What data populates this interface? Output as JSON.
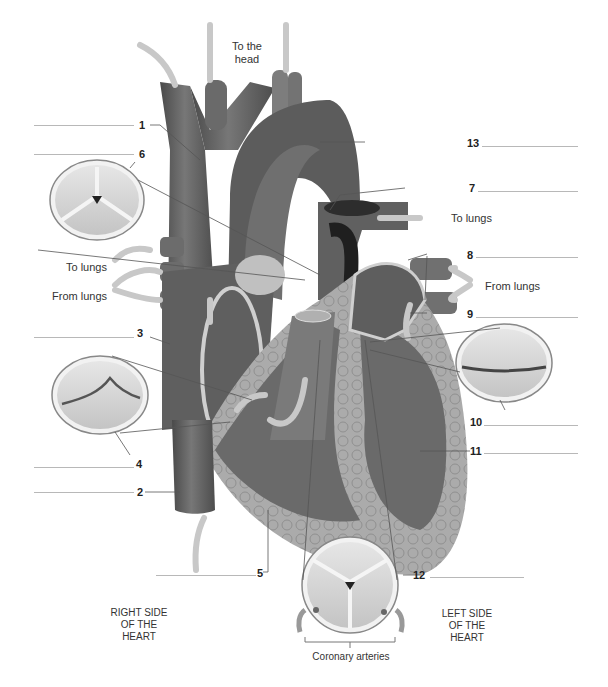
{
  "diagram": {
    "side_labels": {
      "right": "RIGHT SIDE OF THE HEART",
      "left": "LEFT SIDE OF THE HEART"
    },
    "flow_labels": {
      "to_head": "To the head",
      "to_lungs_right": "To lungs",
      "to_lungs_left": "To lungs",
      "from_lungs_left": "From lungs",
      "from_lungs_right": "From lungs"
    },
    "valve_caption": "Coronary arteries",
    "callouts": [
      {
        "number": "1",
        "answer": ""
      },
      {
        "number": "2",
        "answer": ""
      },
      {
        "number": "3",
        "answer": ""
      },
      {
        "number": "4",
        "answer": ""
      },
      {
        "number": "5",
        "answer": ""
      },
      {
        "number": "6",
        "answer": ""
      },
      {
        "number": "7",
        "answer": ""
      },
      {
        "number": "8",
        "answer": ""
      },
      {
        "number": "9",
        "answer": ""
      },
      {
        "number": "10",
        "answer": ""
      },
      {
        "number": "11",
        "answer": ""
      },
      {
        "number": "12",
        "answer": ""
      },
      {
        "number": "13",
        "answer": ""
      }
    ],
    "colors": {
      "vessel_dark": "#5a5a5a",
      "chamber": "#6e6e6e",
      "muscle": "#a9a9a9",
      "arrow": "#c8c8c8",
      "valve_fill": "#d6d6d6",
      "leader_line": "#555555",
      "blank_line": "#b8b8b8"
    }
  }
}
